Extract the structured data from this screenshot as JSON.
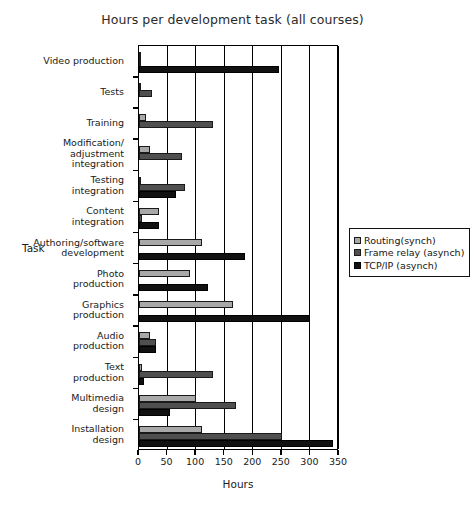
{
  "chart_data": {
    "type": "bar",
    "orientation": "horizontal",
    "title": "Hours per development task (all courses)",
    "xlabel": "Hours",
    "ylabel": "Task",
    "xlim": [
      0,
      350
    ],
    "xticks": [
      0,
      50,
      100,
      150,
      200,
      250,
      300,
      350
    ],
    "grid": "vertical",
    "legend_position": "right",
    "categories": [
      "Video production",
      "Tests",
      "Training",
      "Modification/\nadjustment\nintegration",
      "Testing\nintegration",
      "Content\nintegration",
      "Authoring/software\ndevelopment",
      "Photo\nproduction",
      "Graphics\nproduction",
      "Audio\nproduction",
      "Text\nproduction",
      "Multimedia\ndesign",
      "Installation\ndesign"
    ],
    "series": [
      {
        "name": "Routing(synch)",
        "color": "#a8a8a8",
        "values": [
          3,
          4,
          12,
          20,
          3,
          35,
          110,
          90,
          165,
          20,
          5,
          100,
          110
        ]
      },
      {
        "name": "Frame relay (asynch)",
        "color": "#4f4f4f",
        "values": [
          2,
          22,
          130,
          75,
          80,
          5,
          0,
          0,
          0,
          30,
          130,
          170,
          250
        ]
      },
      {
        "name": "TCP/IP (asynch)",
        "color": "#111111",
        "values": [
          245,
          0,
          0,
          0,
          65,
          35,
          185,
          120,
          300,
          30,
          8,
          55,
          340
        ]
      }
    ]
  },
  "legend": {
    "entries": [
      {
        "label": "Routing(synch)"
      },
      {
        "label": "Frame relay (asynch)"
      },
      {
        "label": "TCP/IP (asynch)"
      }
    ]
  }
}
